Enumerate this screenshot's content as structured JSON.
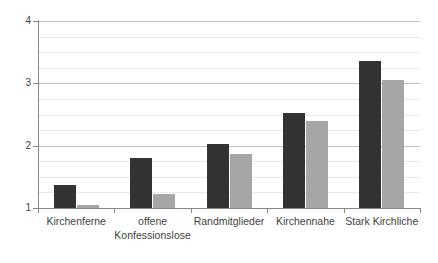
{
  "chart_data": {
    "type": "bar",
    "title": "",
    "subtitle": "",
    "xlabel": "",
    "ylabel": "",
    "categories": [
      "Kirchenferne",
      "offene Konfessionslose",
      "Randmitglieder",
      "Kirchennahe",
      "Stark Kirchliche"
    ],
    "series": [
      {
        "name": "series-1",
        "color": "#333333",
        "values": [
          1.37,
          1.8,
          2.03,
          2.52,
          3.36
        ]
      },
      {
        "name": "series-2",
        "color": "#a6a6a6",
        "values": [
          1.05,
          1.22,
          1.86,
          2.4,
          3.06
        ]
      }
    ],
    "ylim": [
      1,
      4
    ],
    "y_ticks": [
      1,
      2,
      3,
      4
    ],
    "y_tick_labels": [
      "1",
      "2",
      "3",
      "4"
    ],
    "minor_gridline_step": 0.25,
    "grid": true,
    "legend": "none",
    "legend_position": "none"
  },
  "axis": {
    "y_labels": [
      "4",
      "3",
      "2",
      "1"
    ]
  }
}
